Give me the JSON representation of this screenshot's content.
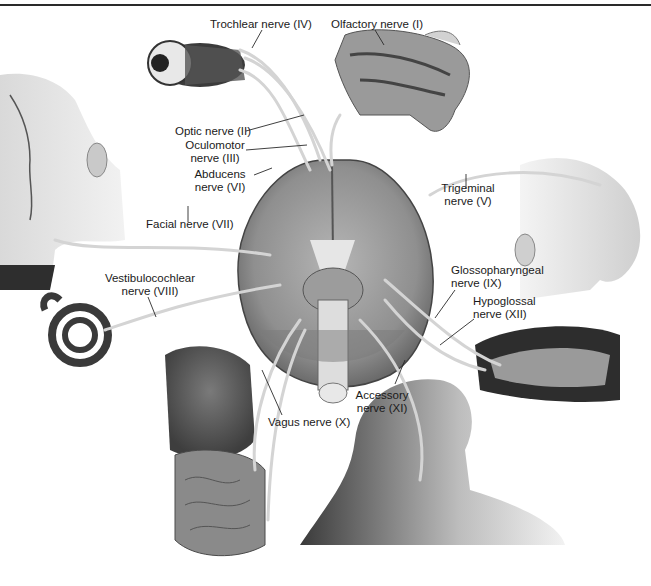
{
  "diagram": {
    "labels": {
      "trochlear": {
        "line1": "Trochlear nerve (IV)"
      },
      "olfactory": {
        "line1": "Olfactory nerve (I)"
      },
      "optic": {
        "line1": "Optic nerve (II)"
      },
      "oculomotor": {
        "line1": "Oculomotor",
        "line2": "nerve (III)"
      },
      "abducens": {
        "line1": "Abducens",
        "line2": "nerve (VI)"
      },
      "facial": {
        "line1": "Facial nerve (VII)"
      },
      "trigeminal": {
        "line1": "Trigeminal",
        "line2": "nerve (V)"
      },
      "vestibulocochlear": {
        "line1": "Vestibulocochlear",
        "line2": "nerve (VIII)"
      },
      "glossopharyngeal": {
        "line1": "Glossopharyngeal",
        "line2": "nerve (IX)"
      },
      "hypoglossal": {
        "line1": "Hypoglossal",
        "line2": "nerve (XII)"
      },
      "accessory": {
        "line1": "Accessory",
        "line2": "nerve (XI)"
      },
      "vagus": {
        "line1": "Vagus nerve (X)"
      }
    },
    "structures": [
      "eye",
      "nasal-cavity",
      "face-left",
      "face-right",
      "brain-inferior-view",
      "inner-ear",
      "tongue-oral-cavity",
      "thoracic-abdominal-organs",
      "neck-shoulder"
    ]
  }
}
